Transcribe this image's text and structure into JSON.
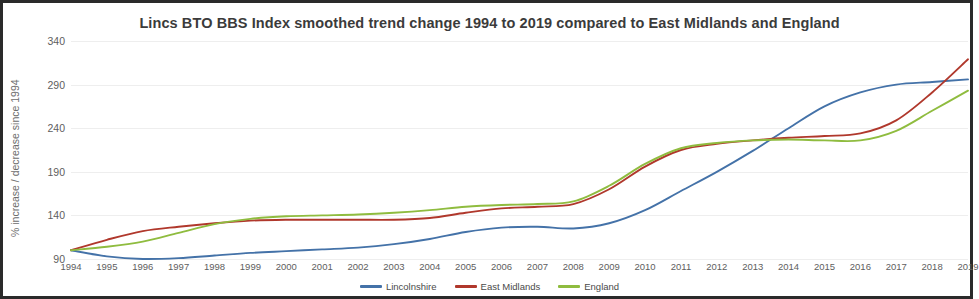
{
  "chart_data": {
    "type": "line",
    "title": "Lincs BTO BBS Index smoothed trend change 1994 to 2019 compared to East Midlands and England",
    "xlabel": "",
    "ylabel": "% increase / decrease since 1994",
    "grid": true,
    "legend_position": "bottom",
    "ylim": [
      90,
      340
    ],
    "yticks": [
      90,
      140,
      190,
      240,
      290,
      340
    ],
    "categories": [
      1994,
      1995,
      1996,
      1997,
      1998,
      1999,
      2000,
      2001,
      2002,
      2003,
      2004,
      2005,
      2006,
      2007,
      2008,
      2009,
      2010,
      2011,
      2012,
      2013,
      2014,
      2015,
      2016,
      2017,
      2018,
      2019
    ],
    "series": [
      {
        "name": "Lincolnshire",
        "color": "#4472a8",
        "values": [
          100,
          93,
          90,
          91,
          94,
          97,
          99,
          101,
          103,
          107,
          113,
          121,
          126,
          127,
          125,
          131,
          146,
          168,
          190,
          214,
          240,
          265,
          281,
          290,
          293,
          296
        ]
      },
      {
        "name": "East Midlands",
        "color": "#b0382c",
        "values": [
          100,
          112,
          122,
          127,
          131,
          134,
          135,
          135,
          135,
          135,
          137,
          143,
          148,
          150,
          153,
          170,
          196,
          215,
          222,
          226,
          229,
          231,
          234,
          249,
          281,
          319
        ]
      },
      {
        "name": "England",
        "color": "#8fbc3f",
        "values": [
          100,
          104,
          110,
          120,
          130,
          136,
          139,
          140,
          141,
          143,
          146,
          150,
          152,
          153,
          156,
          174,
          199,
          217,
          223,
          226,
          227,
          226,
          226,
          237,
          260,
          283
        ]
      }
    ]
  },
  "legend": {
    "items": [
      {
        "label": "Lincolnshire",
        "color": "#4472a8"
      },
      {
        "label": "East Midlands",
        "color": "#b0382c"
      },
      {
        "label": "England",
        "color": "#8fbc3f"
      }
    ]
  }
}
